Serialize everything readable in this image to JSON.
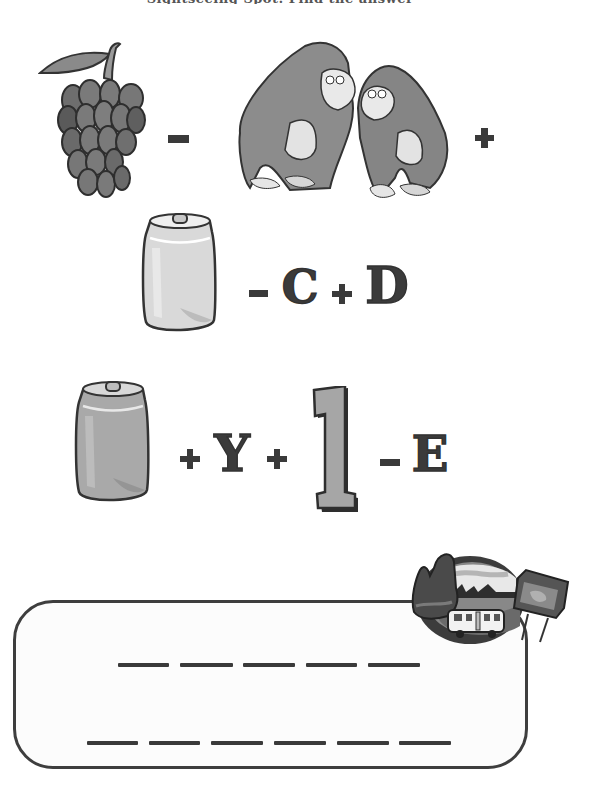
{
  "title": "Sightseeing Spot: Find the answer",
  "puzzle": {
    "row1": {
      "items": [
        {
          "type": "picture",
          "name": "grapes"
        },
        {
          "type": "operator",
          "value": "-"
        },
        {
          "type": "picture",
          "name": "gorillas (apes)"
        },
        {
          "type": "operator",
          "value": "+"
        }
      ],
      "minus": "−",
      "plus": "+"
    },
    "row2": {
      "items": [
        {
          "type": "picture",
          "name": "silver can"
        },
        {
          "type": "operator",
          "value": "-"
        },
        {
          "type": "letter",
          "value": "C"
        },
        {
          "type": "operator",
          "value": "+"
        },
        {
          "type": "letter",
          "value": "D"
        }
      ],
      "minus": "−",
      "letter_c": "C",
      "plus": "+",
      "letter_d": "D"
    },
    "row3": {
      "items": [
        {
          "type": "picture",
          "name": "tin can"
        },
        {
          "type": "operator",
          "value": "+"
        },
        {
          "type": "letter",
          "value": "Y"
        },
        {
          "type": "operator",
          "value": "+"
        },
        {
          "type": "number",
          "value": "1"
        },
        {
          "type": "operator",
          "value": "-"
        },
        {
          "type": "letter",
          "value": "E"
        }
      ],
      "plus1": "+",
      "letter_y": "Y",
      "plus2": "+",
      "number_one": "1",
      "minus": "−",
      "letter_e": "E"
    }
  },
  "answer_box": {
    "line1_blanks": 5,
    "line2_blanks": 6
  },
  "badge": {
    "name": "road-trip-badge",
    "depicts": [
      "rock formations",
      "RV / motorhome",
      "map sign",
      "landscape"
    ]
  },
  "colors": {
    "ink": "#3a3a3a",
    "grape": "#7a7a7a",
    "gorilla": "#8c8c8c",
    "can_light": "#d9d9d9",
    "can_dark": "#a9a9a9",
    "number_fill": "#a6a6a6"
  }
}
